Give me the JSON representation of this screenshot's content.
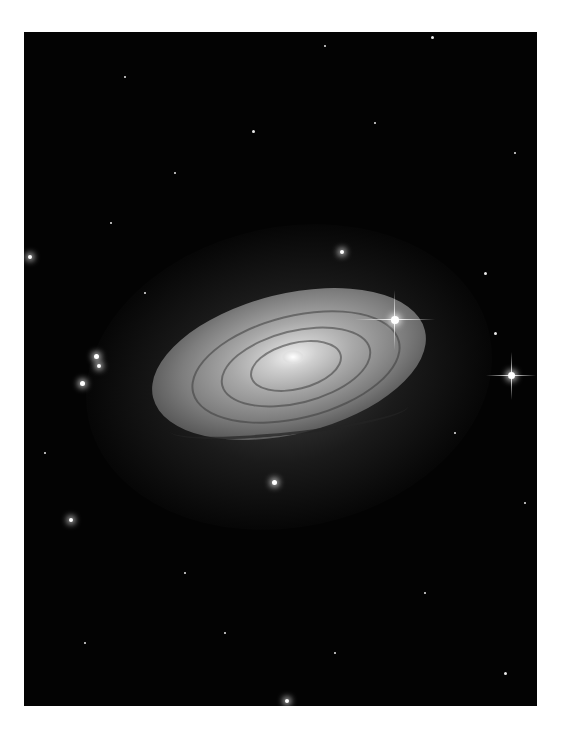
{
  "image": {
    "subject": "spiral galaxy with foreground stars",
    "background_color": "#ffffff",
    "frame_color": "#030303"
  }
}
